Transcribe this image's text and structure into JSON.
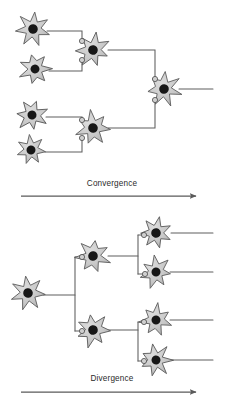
{
  "figure": {
    "background_color": "#ffffff"
  },
  "style": {
    "soma_fill": "#c9c9c9",
    "soma_stroke": "#5a5a5a",
    "nucleus_fill": "#171717",
    "axon_stroke": "#5e5e5e",
    "bouton_fill": "#d0d0d0",
    "bouton_stroke": "#4a4a4a",
    "arrow_stroke": "#5a5a5a",
    "label_color": "#2b2b2b"
  },
  "panels": [
    {
      "id": "convergence",
      "caption": "Convergence",
      "caption_x": 112,
      "caption_y": 186,
      "arrow": {
        "x1": 21,
        "x2": 196,
        "y": 196
      },
      "neurons": [
        {
          "id": "conv-input-1",
          "role": "presynaptic-input",
          "cx": 33,
          "cy": 29,
          "r": 16,
          "rotation": 6
        },
        {
          "id": "conv-input-2",
          "role": "presynaptic-input",
          "cx": 35,
          "cy": 69,
          "r": 15,
          "rotation": -14
        },
        {
          "id": "conv-input-3",
          "role": "presynaptic-input",
          "cx": 32,
          "cy": 115,
          "r": 15,
          "rotation": 18
        },
        {
          "id": "conv-input-4",
          "role": "presynaptic-input",
          "cx": 31,
          "cy": 150,
          "r": 15,
          "rotation": -6
        },
        {
          "id": "conv-relay-upper",
          "role": "relay",
          "cx": 93,
          "cy": 50,
          "r": 16,
          "rotation": 10
        },
        {
          "id": "conv-relay-lower",
          "role": "relay",
          "cx": 93,
          "cy": 128,
          "r": 16,
          "rotation": -8
        },
        {
          "id": "conv-output",
          "role": "postsynaptic-output",
          "cx": 164,
          "cy": 89,
          "r": 16,
          "rotation": 4
        }
      ],
      "axons": [
        {
          "id": "conv-axon-1",
          "d": "M 47 31 L 82 31 L 82 41"
        },
        {
          "id": "conv-axon-2",
          "d": "M 49 71 L 82 71 L 82 60"
        },
        {
          "id": "conv-axon-3",
          "d": "M 46 117 L 82 117 L 82 120"
        },
        {
          "id": "conv-axon-4",
          "d": "M 45 152 L 82 152 L 82 138"
        },
        {
          "id": "conv-axon-relay-upper",
          "d": "M 108 50 L 155 50 L 155 79"
        },
        {
          "id": "conv-axon-relay-lower",
          "d": "M 108 128 L 155 128 L 155 100"
        },
        {
          "id": "conv-axon-output",
          "d": "M 179 89 L 213 89"
        }
      ],
      "boutons": [
        {
          "id": "conv-bouton-1",
          "cx": 82,
          "cy": 41,
          "r": 2.6
        },
        {
          "id": "conv-bouton-2",
          "cx": 82,
          "cy": 60,
          "r": 2.6
        },
        {
          "id": "conv-bouton-3",
          "cx": 82,
          "cy": 120,
          "r": 2.6
        },
        {
          "id": "conv-bouton-4",
          "cx": 82,
          "cy": 138,
          "r": 2.6
        },
        {
          "id": "conv-bouton-5",
          "cx": 155,
          "cy": 79,
          "r": 2.6
        },
        {
          "id": "conv-bouton-6",
          "cx": 155,
          "cy": 100,
          "r": 2.6
        }
      ]
    },
    {
      "id": "divergence",
      "caption": "Divergence",
      "caption_x": 112,
      "caption_y": 381,
      "arrow": {
        "x1": 21,
        "x2": 196,
        "y": 392
      },
      "neurons": [
        {
          "id": "div-source",
          "role": "presynaptic-input",
          "cx": 28,
          "cy": 293,
          "r": 16,
          "rotation": -8
        },
        {
          "id": "div-relay-upper",
          "role": "relay",
          "cx": 93,
          "cy": 256,
          "r": 16,
          "rotation": 8
        },
        {
          "id": "div-relay-lower",
          "role": "relay",
          "cx": 93,
          "cy": 330,
          "r": 16,
          "rotation": -10
        },
        {
          "id": "div-target-1",
          "role": "postsynaptic-output",
          "cx": 156,
          "cy": 233,
          "r": 16,
          "rotation": 12
        },
        {
          "id": "div-target-2",
          "role": "postsynaptic-output",
          "cx": 156,
          "cy": 272,
          "r": 15,
          "rotation": -6
        },
        {
          "id": "div-target-3",
          "role": "postsynaptic-output",
          "cx": 156,
          "cy": 320,
          "r": 15,
          "rotation": 6
        },
        {
          "id": "div-target-4",
          "role": "postsynaptic-output",
          "cx": 156,
          "cy": 360,
          "r": 15,
          "rotation": -12
        }
      ],
      "axons": [
        {
          "id": "div-axon-source",
          "d": "M 43 295 L 75 295"
        },
        {
          "id": "div-axon-trunk",
          "d": "M 75 295 L 75 257 M 75 295 L 75 331"
        },
        {
          "id": "div-axon-trunk-upper-in",
          "d": "M 75 257 L 82 257"
        },
        {
          "id": "div-axon-trunk-lower-in",
          "d": "M 75 331 L 82 331"
        },
        {
          "id": "div-axon-relay-upper",
          "d": "M 108 256 L 138 256"
        },
        {
          "id": "div-axon-branch-upper",
          "d": "M 138 256 L 138 235 M 138 256 L 138 274"
        },
        {
          "id": "div-axon-branch-upper-1",
          "d": "M 138 235 L 144 235"
        },
        {
          "id": "div-axon-branch-upper-2",
          "d": "M 138 274 L 145 274"
        },
        {
          "id": "div-axon-relay-lower",
          "d": "M 108 330 L 138 330"
        },
        {
          "id": "div-axon-branch-lower",
          "d": "M 138 330 L 138 322 M 138 330 L 138 361"
        },
        {
          "id": "div-axon-branch-lower-1",
          "d": "M 138 322 L 144 322"
        },
        {
          "id": "div-axon-branch-lower-2",
          "d": "M 138 361 L 144 361"
        },
        {
          "id": "div-axon-out-1",
          "d": "M 171 233 L 213 233"
        },
        {
          "id": "div-axon-out-2",
          "d": "M 170 272 L 213 272"
        },
        {
          "id": "div-axon-out-3",
          "d": "M 170 320 L 213 320"
        },
        {
          "id": "div-axon-out-4",
          "d": "M 170 360 L 213 360"
        }
      ],
      "boutons": [
        {
          "id": "div-bouton-1",
          "cx": 82,
          "cy": 257,
          "r": 2.6
        },
        {
          "id": "div-bouton-2",
          "cx": 82,
          "cy": 331,
          "r": 2.6
        },
        {
          "id": "div-bouton-3",
          "cx": 144,
          "cy": 235,
          "r": 2.6
        },
        {
          "id": "div-bouton-4",
          "cx": 145,
          "cy": 274,
          "r": 2.6
        },
        {
          "id": "div-bouton-5",
          "cx": 144,
          "cy": 322,
          "r": 2.6
        },
        {
          "id": "div-bouton-6",
          "cx": 144,
          "cy": 361,
          "r": 2.6
        }
      ]
    }
  ]
}
